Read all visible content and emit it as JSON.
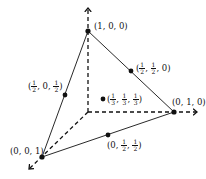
{
  "diagram": {
    "type": "barycentric-simplex",
    "stroke_color": "#111111",
    "axes": [
      {
        "id": "axis-1",
        "direction": "up"
      },
      {
        "id": "axis-2",
        "direction": "right"
      },
      {
        "id": "axis-3",
        "direction": "down-left"
      }
    ],
    "points": [
      {
        "id": "v100",
        "label": "(1, 0, 0)"
      },
      {
        "id": "v010",
        "label": "(0, 1, 0)"
      },
      {
        "id": "v001",
        "label": "(0, 0, 1)"
      },
      {
        "id": "m_half_half_0",
        "label": "(1/2, 1/2, 0)"
      },
      {
        "id": "m_half_0_half",
        "label": "(1/2, 0, 1/2)"
      },
      {
        "id": "m_0_half_half",
        "label": "(0, 1/2, 1/2)"
      },
      {
        "id": "centroid",
        "label": "(1/3, 1/3, 1/3)"
      }
    ],
    "labels": {
      "v100": "(1, 0, 0)",
      "v010": "(0, 1, 0)",
      "v001": "(0, 0, 1)",
      "half": {
        "num": "1",
        "den": "2"
      },
      "third": {
        "num": "1",
        "den": "3"
      },
      "zero": "0",
      "open": "(",
      "close": ")",
      "comma": ", "
    }
  }
}
